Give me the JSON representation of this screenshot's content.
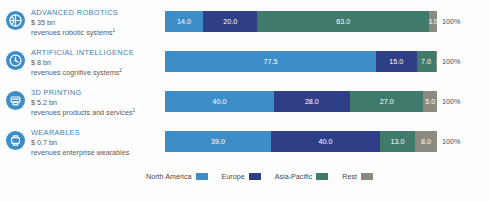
{
  "chart_data": {
    "type": "bar",
    "subtype": "stacked-horizontal-100",
    "title": "",
    "xlabel": "",
    "ylabel": "",
    "grid": false,
    "legend_position": "bottom",
    "xlim": [
      0,
      100
    ],
    "unit": "%",
    "total_label": "100%",
    "categories": [
      "ADVANCED ROBOTICS",
      "ARTIFICIAL INTELLIGENCE",
      "3D PRINTING",
      "WEARABLES"
    ],
    "series": [
      {
        "name": "North America",
        "color": "#3d8dc9",
        "values": [
          14.0,
          77.5,
          40.0,
          39.0
        ]
      },
      {
        "name": "Europe",
        "color": "#2e3f87",
        "values": [
          20.0,
          15.0,
          28.0,
          40.0
        ]
      },
      {
        "name": "Asia-Pacific",
        "color": "#3f7a6b",
        "values": [
          63.0,
          7.0,
          27.0,
          13.0
        ]
      },
      {
        "name": "Rest",
        "color": "#8a8a80",
        "values": [
          3.0,
          0.5,
          5.0,
          8.0
        ]
      }
    ]
  },
  "rows": [
    {
      "icon": "globe-robot-icon",
      "title": "ADVANCED ROBOTICS",
      "value": "$ 35 bn",
      "desc": "revenues robotic systems",
      "footnote": "1",
      "total": "100%",
      "segments": [
        {
          "region": "North America",
          "label": "14.0",
          "value": 14.0,
          "color": "#3d8dc9"
        },
        {
          "region": "Europe",
          "label": "20.0",
          "value": 20.0,
          "color": "#2e3f87"
        },
        {
          "region": "Asia-Pacific",
          "label": "63.0",
          "value": 63.0,
          "color": "#3f7a6b"
        },
        {
          "region": "Rest",
          "label": "3.0",
          "value": 3.0,
          "color": "#8a8a80"
        }
      ]
    },
    {
      "icon": "brain-chip-icon",
      "title": "ARTIFICIAL INTELLIGENCE",
      "value": "$ 8 bn",
      "desc": "revenues cognitive systems",
      "footnote": "2",
      "total": "100%",
      "segments": [
        {
          "region": "North America",
          "label": "77.5",
          "value": 77.5,
          "color": "#3d8dc9"
        },
        {
          "region": "Europe",
          "label": "15.0",
          "value": 15.0,
          "color": "#2e3f87"
        },
        {
          "region": "Asia-Pacific",
          "label": "7.0",
          "value": 7.0,
          "color": "#3f7a6b"
        },
        {
          "region": "Rest",
          "label": "0.5",
          "value": 0.5,
          "color": "#8a8a80"
        }
      ]
    },
    {
      "icon": "printer-3d-icon",
      "title": "3D PRINTING",
      "value": "$ 5.2 bn",
      "desc": "revenues products and services",
      "footnote": "1",
      "total": "100%",
      "segments": [
        {
          "region": "North America",
          "label": "40.0",
          "value": 40.0,
          "color": "#3d8dc9"
        },
        {
          "region": "Europe",
          "label": "28.0",
          "value": 28.0,
          "color": "#2e3f87"
        },
        {
          "region": "Asia-Pacific",
          "label": "27.0",
          "value": 27.0,
          "color": "#3f7a6b"
        },
        {
          "region": "Rest",
          "label": "5.0",
          "value": 5.0,
          "color": "#8a8a80"
        }
      ]
    },
    {
      "icon": "smartwatch-icon",
      "title": "WEARABLES",
      "value": "$ 0.7 bn",
      "desc": "revenues enterprise wearables",
      "footnote": "",
      "total": "100%",
      "segments": [
        {
          "region": "North America",
          "label": "39.0",
          "value": 39.0,
          "color": "#3d8dc9"
        },
        {
          "region": "Europe",
          "label": "40.0",
          "value": 40.0,
          "color": "#2e3f87"
        },
        {
          "region": "Asia-Pacific",
          "label": "13.0",
          "value": 13.0,
          "color": "#3f7a6b"
        },
        {
          "region": "Rest",
          "label": "8.0",
          "value": 8.0,
          "color": "#8a8a80"
        }
      ]
    }
  ],
  "legend": {
    "items": [
      {
        "label": "North America",
        "color": "#3d8dc9"
      },
      {
        "label": "Europe",
        "color": "#2e3f87"
      },
      {
        "label": "Asia-Pacific",
        "color": "#3f7a6b"
      },
      {
        "label": "Rest",
        "color": "#8a8a80"
      }
    ]
  },
  "colors": {
    "north_america": "#3d8dc9",
    "europe": "#2e3f87",
    "asia_pacific": "#3f7a6b",
    "rest": "#8a8a80",
    "title_text": "#3d7fb5",
    "body_text": "#5c5c5c"
  }
}
